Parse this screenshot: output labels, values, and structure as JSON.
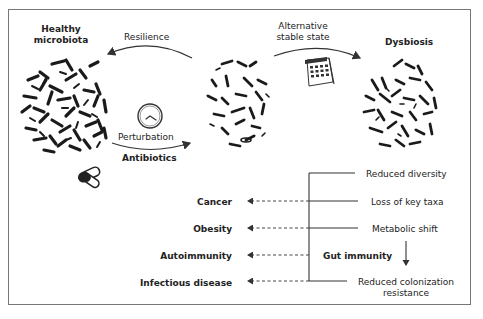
{
  "states": {
    "healthy": {
      "title_line1": "Healthy",
      "title_line2": "microbiota"
    },
    "middle": {
      "title": ""
    },
    "dysbiosis": {
      "title": "Dysbiosis"
    }
  },
  "arrows": {
    "resilience": "Resilience",
    "alternative_line1": "Alternative",
    "alternative_line2": "stable state",
    "perturbation": "Perturbation",
    "antibiotics": "Antibiotics"
  },
  "icons": {
    "clock": "clock-icon",
    "calendar": "calendar-icon",
    "pill": "pill-capsule-icon"
  },
  "diseases": [
    "Cancer",
    "Obesity",
    "Autoimmunity",
    "Infectious disease"
  ],
  "effects": {
    "reduced_diversity": "Reduced diversity",
    "loss_key_taxa": "Loss of key taxa",
    "metabolic_shift": "Metabolic shift",
    "gut_immunity": "Gut immunity",
    "reduced_colonization_line1": "Reduced colonization",
    "reduced_colonization_line2": "resistance"
  },
  "colors": {
    "ink": "#222222",
    "border": "#777777",
    "bacteria": "#1a1a1a"
  }
}
